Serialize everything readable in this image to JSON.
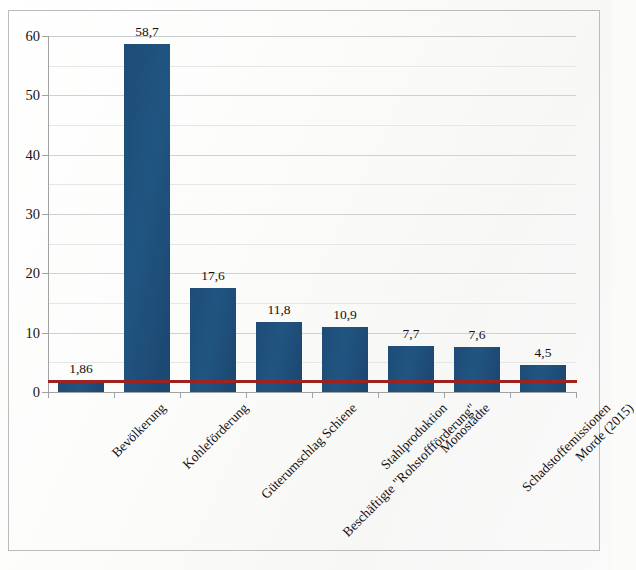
{
  "chart_data": {
    "type": "bar",
    "title": "",
    "subtitle": "",
    "xlabel": "",
    "ylabel": "",
    "ylim": [
      0,
      60
    ],
    "ytick_step": 10,
    "minor_gridline_step": 5,
    "grid": true,
    "legend": "none",
    "categories": [
      "Bevölkerung",
      "Kohleförderung",
      "Güterumschlag Schiene",
      "Beschäftigte \"Rohstoffförderung\"",
      "Stahlproduktion",
      "Monostädte",
      "Schadstoffemissionen",
      "Morde (2015)"
    ],
    "values": [
      1.86,
      58.7,
      17.6,
      11.8,
      10.9,
      7.7,
      7.6,
      4.5
    ],
    "value_labels": [
      "1,86",
      "58,7",
      "17,6",
      "11,8",
      "10,9",
      "7,7",
      "7,6",
      "4,5"
    ],
    "ytick_labels": [
      "0",
      "10",
      "20",
      "30",
      "40",
      "50",
      "60"
    ],
    "ytick_values": [
      0,
      10,
      20,
      30,
      40,
      50,
      60
    ],
    "reference_line": {
      "value": 1.86,
      "label": "",
      "color": "#9c2420"
    },
    "series": [
      {
        "name": "Anteil",
        "color": "#1f4e79",
        "values": [
          1.86,
          58.7,
          17.6,
          11.8,
          10.9,
          7.7,
          7.6,
          4.5
        ]
      }
    ],
    "colors": {
      "bar": "#1f4e79",
      "reference_line": "#9c2420",
      "gridline_major": "#cfd2d4",
      "gridline_minor": "#e4e6e7",
      "axis": "#9fa3a6",
      "text": "#111111",
      "background": "#fbfbfa",
      "frame_border": "#b9bcbe"
    }
  }
}
